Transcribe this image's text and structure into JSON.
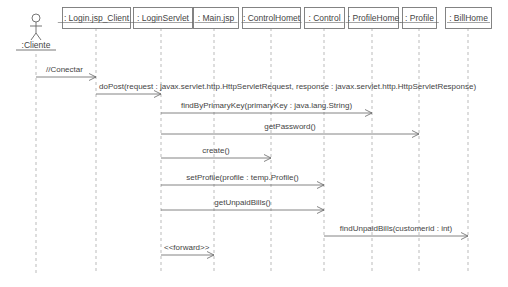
{
  "diagram": {
    "type": "uml-sequence",
    "actor": {
      "label": ":Cliente",
      "x": 36
    },
    "lifelines": [
      {
        "id": "login_jsp_client",
        "label": ": Login.jsp_Client",
        "x": 96,
        "box": [
          62,
          7,
          68,
          21
        ]
      },
      {
        "id": "login_servlet",
        "label": ": LoginServlet",
        "x": 161,
        "box": [
          133,
          7,
          59,
          21
        ]
      },
      {
        "id": "main_jsp",
        "label": ": Main.jsp",
        "x": 214,
        "box": [
          193,
          7,
          45,
          21
        ]
      },
      {
        "id": "control_homet",
        "label": ": ControlHomet",
        "x": 271,
        "box": [
          242,
          7,
          58,
          21
        ]
      },
      {
        "id": "control",
        "label": ": Control",
        "x": 324,
        "box": [
          304,
          7,
          40,
          21
        ]
      },
      {
        "id": "profile_home",
        "label": ": ProfileHome",
        "x": 372,
        "box": [
          348,
          7,
          50,
          21
        ]
      },
      {
        "id": "profile",
        "label": ": Profile",
        "x": 419,
        "box": [
          402,
          7,
          34,
          21
        ]
      },
      {
        "id": "bill_home",
        "label": ": BillHome",
        "x": 468,
        "box": [
          445,
          7,
          46,
          21
        ]
      }
    ],
    "lifeline_bottom": 273,
    "messages": [
      {
        "label": "//Conectar",
        "from_x": 36,
        "to_x": 96,
        "y": 77
      },
      {
        "label": "doPost(request : javax.servlet.http.HttpServletRequest, response : javax.servlet.http.HttpServletResponse)",
        "from_x": 96,
        "to_x": 161,
        "y": 94
      },
      {
        "label": "findByPrimaryKey(primaryKey : java.lang.String)",
        "from_x": 161,
        "to_x": 372,
        "y": 113
      },
      {
        "label": "getPassword()",
        "from_x": 161,
        "to_x": 419,
        "y": 134
      },
      {
        "label": "create()",
        "from_x": 161,
        "to_x": 271,
        "y": 158
      },
      {
        "label": "setProfile(profile : temp.Profile()",
        "from_x": 161,
        "to_x": 324,
        "y": 185
      },
      {
        "label": "getUnpaidBills()",
        "from_x": 161,
        "to_x": 324,
        "y": 210
      },
      {
        "label": "findUnpaidBills(customerid : int)",
        "from_x": 324,
        "to_x": 468,
        "y": 236
      },
      {
        "label": "<<forward>>",
        "from_x": 161,
        "to_x": 214,
        "y": 255
      }
    ]
  }
}
